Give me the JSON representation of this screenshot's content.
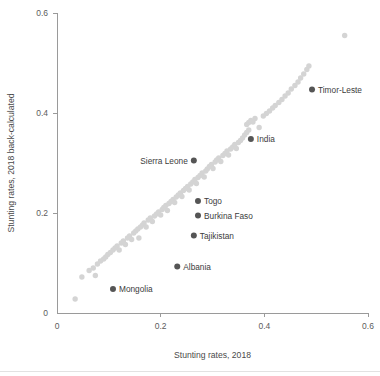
{
  "chart_data": {
    "type": "scatter",
    "title": "",
    "xlabel": "Stunting rates, 2018",
    "ylabel": "Stunting rates, 2018 back-calculated",
    "xlim": [
      0,
      0.6
    ],
    "ylim": [
      0,
      0.6
    ],
    "xticks": [
      0,
      0.2,
      0.4,
      0.6
    ],
    "xtick_labels": [
      "0",
      "0.2",
      "0.4",
      "0.6"
    ],
    "yticks": [
      0,
      0.2,
      0.4,
      0.6
    ],
    "ytick_labels": [
      "0",
      "0.2",
      "0.4",
      "0.6"
    ],
    "grid": false,
    "legend": false,
    "marker_colors": {
      "cloud": "#d4d4d4",
      "highlight": "#555555"
    },
    "labeled_points": [
      {
        "name": "Timor-Leste",
        "x": 0.492,
        "y": 0.447,
        "label_side": "right"
      },
      {
        "name": "India",
        "x": 0.374,
        "y": 0.348,
        "label_side": "right"
      },
      {
        "name": "Sierra Leone",
        "x": 0.264,
        "y": 0.305,
        "label_side": "left"
      },
      {
        "name": "Togo",
        "x": 0.272,
        "y": 0.224,
        "label_side": "right"
      },
      {
        "name": "Burkina Faso",
        "x": 0.272,
        "y": 0.195,
        "label_side": "right"
      },
      {
        "name": "Tajikistan",
        "x": 0.264,
        "y": 0.155,
        "label_side": "right"
      },
      {
        "name": "Albania",
        "x": 0.232,
        "y": 0.093,
        "label_side": "right"
      },
      {
        "name": "Mongolia",
        "x": 0.108,
        "y": 0.048,
        "label_side": "right"
      }
    ],
    "cloud_points": [
      [
        0.035,
        0.028
      ],
      [
        0.048,
        0.072
      ],
      [
        0.062,
        0.085
      ],
      [
        0.07,
        0.09
      ],
      [
        0.074,
        0.075
      ],
      [
        0.078,
        0.098
      ],
      [
        0.084,
        0.104
      ],
      [
        0.09,
        0.108
      ],
      [
        0.094,
        0.112
      ],
      [
        0.098,
        0.117
      ],
      [
        0.103,
        0.121
      ],
      [
        0.108,
        0.126
      ],
      [
        0.112,
        0.13
      ],
      [
        0.116,
        0.134
      ],
      [
        0.12,
        0.126
      ],
      [
        0.124,
        0.14
      ],
      [
        0.128,
        0.144
      ],
      [
        0.132,
        0.137
      ],
      [
        0.136,
        0.15
      ],
      [
        0.14,
        0.154
      ],
      [
        0.144,
        0.147
      ],
      [
        0.148,
        0.16
      ],
      [
        0.152,
        0.164
      ],
      [
        0.156,
        0.168
      ],
      [
        0.158,
        0.15
      ],
      [
        0.161,
        0.172
      ],
      [
        0.165,
        0.176
      ],
      [
        0.168,
        0.18
      ],
      [
        0.172,
        0.172
      ],
      [
        0.176,
        0.186
      ],
      [
        0.18,
        0.19
      ],
      [
        0.184,
        0.183
      ],
      [
        0.188,
        0.194
      ],
      [
        0.192,
        0.198
      ],
      [
        0.196,
        0.202
      ],
      [
        0.2,
        0.196
      ],
      [
        0.203,
        0.207
      ],
      [
        0.206,
        0.211
      ],
      [
        0.21,
        0.215
      ],
      [
        0.213,
        0.205
      ],
      [
        0.216,
        0.219
      ],
      [
        0.22,
        0.223
      ],
      [
        0.224,
        0.227
      ],
      [
        0.227,
        0.221
      ],
      [
        0.23,
        0.232
      ],
      [
        0.234,
        0.236
      ],
      [
        0.238,
        0.24
      ],
      [
        0.241,
        0.233
      ],
      [
        0.244,
        0.245
      ],
      [
        0.248,
        0.249
      ],
      [
        0.252,
        0.253
      ],
      [
        0.255,
        0.246
      ],
      [
        0.258,
        0.258
      ],
      [
        0.262,
        0.262
      ],
      [
        0.266,
        0.267
      ],
      [
        0.269,
        0.259
      ],
      [
        0.272,
        0.271
      ],
      [
        0.276,
        0.275
      ],
      [
        0.28,
        0.28
      ],
      [
        0.284,
        0.272
      ],
      [
        0.287,
        0.284
      ],
      [
        0.29,
        0.288
      ],
      [
        0.294,
        0.293
      ],
      [
        0.298,
        0.297
      ],
      [
        0.301,
        0.289
      ],
      [
        0.305,
        0.302
      ],
      [
        0.308,
        0.306
      ],
      [
        0.312,
        0.31
      ],
      [
        0.316,
        0.303
      ],
      [
        0.32,
        0.315
      ],
      [
        0.324,
        0.319
      ],
      [
        0.328,
        0.324
      ],
      [
        0.331,
        0.316
      ],
      [
        0.335,
        0.328
      ],
      [
        0.339,
        0.332
      ],
      [
        0.343,
        0.337
      ],
      [
        0.346,
        0.329
      ],
      [
        0.35,
        0.341
      ],
      [
        0.354,
        0.345
      ],
      [
        0.358,
        0.35
      ],
      [
        0.362,
        0.356
      ],
      [
        0.366,
        0.361
      ],
      [
        0.37,
        0.366
      ],
      [
        0.366,
        0.377
      ],
      [
        0.37,
        0.381
      ],
      [
        0.374,
        0.385
      ],
      [
        0.378,
        0.382
      ],
      [
        0.382,
        0.389
      ],
      [
        0.39,
        0.371
      ],
      [
        0.398,
        0.394
      ],
      [
        0.404,
        0.399
      ],
      [
        0.41,
        0.404
      ],
      [
        0.416,
        0.41
      ],
      [
        0.421,
        0.415
      ],
      [
        0.428,
        0.421
      ],
      [
        0.434,
        0.427
      ],
      [
        0.44,
        0.434
      ],
      [
        0.446,
        0.44
      ],
      [
        0.452,
        0.448
      ],
      [
        0.459,
        0.455
      ],
      [
        0.465,
        0.462
      ],
      [
        0.47,
        0.47
      ],
      [
        0.476,
        0.478
      ],
      [
        0.482,
        0.487
      ],
      [
        0.486,
        0.494
      ],
      [
        0.555,
        0.555
      ]
    ]
  }
}
